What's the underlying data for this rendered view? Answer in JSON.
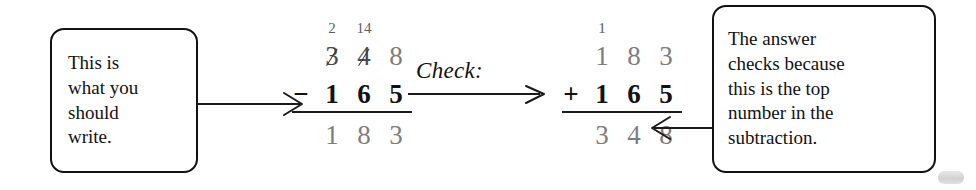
{
  "figure": {
    "background_color": "#ffffff",
    "ink_color": "#111111",
    "light_digit_color": "#7d7d7d"
  },
  "callouts": {
    "left": {
      "text": "This is\nwhat you\nshould\nwrite."
    },
    "right": {
      "text": "The answer\nchecks because\nthis is the top\nnumber in the\nsubtraction."
    }
  },
  "check": {
    "label": "Check:"
  },
  "subtraction": {
    "borrow_marks": [
      "2",
      "14",
      ""
    ],
    "minuend_digits": [
      "3",
      "4",
      "8"
    ],
    "minuend_struck": [
      true,
      true,
      false
    ],
    "operator": "−",
    "subtrahend_digits": [
      "1",
      "6",
      "5"
    ],
    "difference_digits": [
      "1",
      "8",
      "3"
    ]
  },
  "addition": {
    "carry_marks": [
      "1",
      "",
      ""
    ],
    "addend_top_digits": [
      "1",
      "8",
      "3"
    ],
    "operator": "+",
    "addend_bottom_digits": [
      "1",
      "6",
      "5"
    ],
    "sum_digits": [
      "3",
      "4",
      "8"
    ]
  },
  "arrows": {
    "left": "arrow-right-icon",
    "right": "arrow-left-icon",
    "check": "arrow-right-icon"
  }
}
